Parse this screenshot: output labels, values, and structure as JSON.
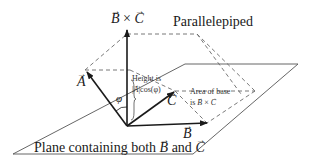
{
  "title": "Parallelepiped",
  "labels": {
    "cross_product": {
      "left": "B",
      "op": "×",
      "right": "C"
    },
    "vector_a": "A",
    "vector_b": "B",
    "vector_c": "C",
    "phi": "φ",
    "height_line1": "Height is",
    "height_line2_vec": "A",
    "height_line2_rest": "cos(φ)",
    "area_line1": "Area of base",
    "area_line2_prefix": "is",
    "area_line2_left": "B",
    "area_line2_op": "×",
    "area_line2_right": "C",
    "plane_prefix": "Plane containing both",
    "plane_b": "B",
    "plane_and": "and",
    "plane_c": "C"
  },
  "colors": {
    "line": "#1a1a1a",
    "dashed": "#6a6a6a",
    "plane": "#555555"
  }
}
